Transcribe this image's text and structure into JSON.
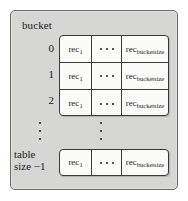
{
  "figure": {
    "caption": "bucket",
    "table_size_label_line1": "table",
    "table_size_label_line2": "size −1",
    "row_indices": [
      "0",
      "1",
      "2"
    ],
    "columns": {
      "first_label": "rec",
      "first_sub": "1",
      "last_label": "rec",
      "last_sub": "bucketsize",
      "middle_label": "· · ·"
    },
    "vertical_ellipsis": "⋮",
    "colors": {
      "panel_background": "#d6d6d4",
      "panel_border": "#6a6a68",
      "cell_background": "#fbfbfa",
      "cell_border": "#3a3a38",
      "text": "#1b1b1b",
      "page_background": "#ffffff"
    }
  }
}
